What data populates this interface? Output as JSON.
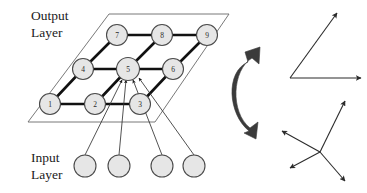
{
  "figure": {
    "background_color": "#ffffff",
    "labels": {
      "output_line1": "Output",
      "output_line2": "Layer",
      "input_line1": "Input",
      "input_line2": "Layer"
    },
    "colors": {
      "node_fill": "#e6e6e6",
      "node_stroke": "#4a4a4a",
      "lattice_link": "#111111",
      "plane_outline": "#555555",
      "connection_line": "#333333",
      "curved_arrow": "#3a3a3a",
      "vector_arrow": "#2b2b2b",
      "text": "#1b1b1b"
    },
    "output_layer": {
      "name": "output-layer-lattice",
      "grid_rows": 3,
      "grid_cols": 3,
      "nodes": [
        {
          "label": "1",
          "cx": 50,
          "cy": 104,
          "r": 10.5
        },
        {
          "label": "2",
          "cx": 95,
          "cy": 104,
          "r": 10.5
        },
        {
          "label": "3",
          "cx": 140,
          "cy": 104,
          "r": 10.5
        },
        {
          "label": "4",
          "cx": 83,
          "cy": 69,
          "r": 10.5
        },
        {
          "label": "5",
          "cx": 128,
          "cy": 69,
          "r": 11.5
        },
        {
          "label": "6",
          "cx": 173,
          "cy": 69,
          "r": 10.5
        },
        {
          "label": "7",
          "cx": 117,
          "cy": 35,
          "r": 10.5
        },
        {
          "label": "8",
          "cx": 162,
          "cy": 35,
          "r": 10.5
        },
        {
          "label": "9",
          "cx": 207,
          "cy": 35,
          "r": 10.5
        }
      ],
      "links": [
        [
          0,
          1
        ],
        [
          1,
          2
        ],
        [
          3,
          4
        ],
        [
          4,
          5
        ],
        [
          6,
          7
        ],
        [
          7,
          8
        ],
        [
          0,
          3
        ],
        [
          3,
          6
        ],
        [
          1,
          4
        ],
        [
          4,
          7
        ],
        [
          2,
          5
        ],
        [
          5,
          8
        ]
      ],
      "plane_polygon": "109,14 229,14 155,122 28,122",
      "winner_node_label": "5"
    },
    "input_layer": {
      "name": "input-layer-units",
      "nodes": [
        {
          "cx": 85,
          "cy": 166,
          "r": 11
        },
        {
          "cx": 119,
          "cy": 166,
          "r": 11
        },
        {
          "cx": 162,
          "cy": 166,
          "r": 11
        },
        {
          "cx": 194,
          "cy": 166,
          "r": 11
        }
      ],
      "connections_to_winner": 4
    },
    "feedback_arrow": {
      "name": "curved-rotation-arrow",
      "shape": "thick-c-curve-double-headed"
    },
    "weight_vectors": {
      "top_group": {
        "name": "weight-vector-fan-top",
        "origin": [
          290,
          78
        ],
        "arrows": [
          {
            "to": [
              338,
              13
            ]
          },
          {
            "to": [
              363,
              78
            ]
          }
        ]
      },
      "bottom_group": {
        "name": "weight-vector-fan-bottom",
        "origin": [
          320,
          152
        ],
        "arrows": [
          {
            "to": [
              345,
              101
            ]
          },
          {
            "to": [
              281,
              131
            ]
          },
          {
            "to": [
              289,
              168
            ]
          },
          {
            "to": [
              346,
              182
            ]
          }
        ]
      }
    }
  }
}
